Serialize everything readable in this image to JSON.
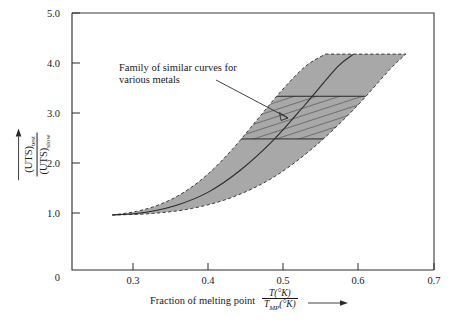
{
  "figure": {
    "name": "ultimate-tensile-strength-vs-fraction-of-melting-point"
  },
  "axes": {
    "y": {
      "numerator": "(UTS)",
      "numerator_sub": "test",
      "denominator": "(UTS)",
      "denominator_sub": "slow",
      "ticks": [
        "0",
        "1.0",
        "2.0",
        "3.0",
        "4.0",
        "5.0"
      ],
      "min": 0,
      "max": 5.0
    },
    "x": {
      "label_text": "Fraction of melting point",
      "numerator": "T(°K)",
      "denominator_main": "T",
      "denominator_sub": "MP",
      "denominator_tail": "(°K)",
      "ticks": [
        "0.3",
        "0.4",
        "0.5",
        "0.6",
        "0.7"
      ],
      "min": 0.25,
      "max": 0.7
    }
  },
  "annotations": {
    "family_note": "Family of similar curves for various metals"
  },
  "colors": {
    "band_fill": "#a8a8a8",
    "axis": "#2a2a2a",
    "text": "#1a1a1a"
  },
  "chart_data": {
    "type": "area",
    "title": "",
    "xlabel": "Fraction of melting point T(°K)/T_MP(°K)",
    "ylabel": "(UTS)_test / (UTS)_slow",
    "xlim": [
      0.25,
      0.7
    ],
    "ylim": [
      0,
      5.0
    ],
    "xticks": [
      0.3,
      0.4,
      0.5,
      0.6,
      0.7
    ],
    "yticks": [
      0,
      1.0,
      2.0,
      3.0,
      4.0,
      5.0
    ],
    "grid": false,
    "legend": "none",
    "series": [
      {
        "name": "Upper bound of family band",
        "style": "dashed-boundary",
        "x": [
          0.3,
          0.33,
          0.36,
          0.39,
          0.42,
          0.45,
          0.48,
          0.51,
          0.54,
          0.565
        ],
        "y": [
          1.07,
          1.14,
          1.28,
          1.52,
          1.88,
          2.36,
          2.92,
          3.48,
          3.96,
          4.2
        ]
      },
      {
        "name": "Mean curve (typical metal)",
        "style": "solid-curve",
        "x": [
          0.3,
          0.34,
          0.38,
          0.42,
          0.46,
          0.5,
          0.54,
          0.58,
          0.6
        ],
        "y": [
          1.07,
          1.12,
          1.26,
          1.52,
          1.95,
          2.52,
          3.22,
          3.95,
          4.2
        ]
      },
      {
        "name": "Lower bound of family band",
        "style": "dashed-boundary",
        "x": [
          0.3,
          0.35,
          0.4,
          0.45,
          0.5,
          0.55,
          0.6,
          0.645,
          0.665
        ],
        "y": [
          1.07,
          1.1,
          1.2,
          1.42,
          1.8,
          2.38,
          3.12,
          3.9,
          4.2
        ]
      }
    ],
    "hatched_region": {
      "description": "Cross-hatched sub-band highlighting the family of similar curves",
      "y_lower": 2.55,
      "y_upper": 3.38
    },
    "band_top_cutoff": 4.2,
    "origin_point": {
      "x": 0.3,
      "y": 1.07
    }
  }
}
